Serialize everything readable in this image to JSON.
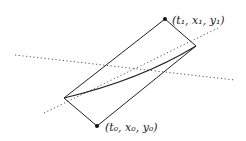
{
  "diagram": {
    "labels": {
      "top_point": "(t₁, x₁, y₁)",
      "bottom_point": "(t₀, x₀, y₀)"
    },
    "colors": {
      "line": "#222222",
      "dotted": "#444444",
      "background": "#ffffff"
    }
  }
}
